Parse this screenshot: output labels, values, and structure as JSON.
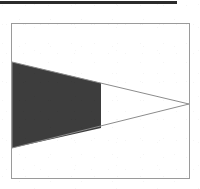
{
  "page": {
    "background_color": "#ffffff",
    "width": 200,
    "height": 189
  },
  "top_rule": {
    "name": "horizontal-rule",
    "color": "#2b2b2b",
    "x": 0,
    "y": 1,
    "width": 177,
    "height": 3
  },
  "figure": {
    "frame": {
      "border_color": "#9a9a9a",
      "background_color": "#ffffff",
      "x": 11,
      "y": 23,
      "width": 179,
      "height": 156
    },
    "chart_data": {
      "type": "area",
      "title": "",
      "subtitle": "",
      "xlabel": "",
      "ylabel": "",
      "grid": false,
      "legend": null,
      "annotations": [],
      "tick_labels": {
        "x": [],
        "y": []
      },
      "xlim": [
        0,
        177
      ],
      "ylim": [
        0,
        154
      ],
      "shapes": [
        {
          "name": "triangle-outline",
          "kind": "polygon",
          "points": [
            [
              0,
              38
            ],
            [
              177,
              80
            ],
            [
              0,
              124
            ]
          ],
          "fill": "none",
          "stroke": "#8c8c8c",
          "stroke_width": 1
        },
        {
          "name": "shaded-trapezoid",
          "kind": "polygon",
          "points": [
            [
              0,
              38
            ],
            [
              89,
              59
            ],
            [
              89,
              104
            ],
            [
              0,
              124
            ]
          ],
          "fill": "#3d3d3d",
          "stroke": "none",
          "stroke_width": 0
        }
      ],
      "series": [
        {
          "name": "upper-edge",
          "x": [
            0,
            89,
            177
          ],
          "values": [
            38,
            59,
            80
          ]
        },
        {
          "name": "lower-edge",
          "x": [
            0,
            89,
            177
          ],
          "values": [
            124,
            104,
            80
          ]
        }
      ],
      "shaded_region": {
        "name": "shaded-trapezoid",
        "x_start": 0,
        "x_end": 89,
        "fill": "#3d3d3d"
      }
    }
  }
}
